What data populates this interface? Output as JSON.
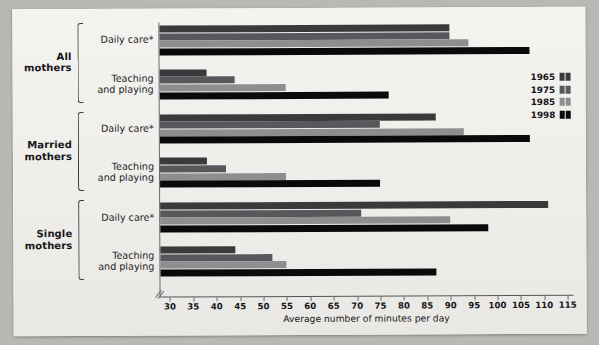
{
  "chart_data": {
    "type": "bar",
    "orientation": "horizontal",
    "title": "",
    "xlabel": "Average number of minutes per day",
    "ylabel": "",
    "xlim": [
      28,
      116
    ],
    "axis_break": true,
    "grid": false,
    "legend_position": "right",
    "xticks": [
      30,
      35,
      40,
      45,
      50,
      55,
      60,
      65,
      70,
      75,
      80,
      85,
      90,
      95,
      100,
      105,
      110,
      115
    ],
    "series": [
      {
        "name": "1965",
        "color": "#3a3a3c"
      },
      {
        "name": "1975",
        "color": "#58585c"
      },
      {
        "name": "1985",
        "color": "#8e8e90"
      },
      {
        "name": "1998",
        "color": "#0a0a0c"
      }
    ],
    "groups": [
      {
        "name": "All mothers",
        "categories": [
          {
            "label_line1": "Daily care*",
            "label_line2": "",
            "values": [
              90,
              90,
              94,
              107
            ]
          },
          {
            "label_line1": "Teaching",
            "label_line2": "and playing",
            "values": [
              38,
              44,
              55,
              77
            ]
          }
        ]
      },
      {
        "name": "Married mothers",
        "categories": [
          {
            "label_line1": "Daily care*",
            "label_line2": "",
            "values": [
              87,
              75,
              93,
              107
            ]
          },
          {
            "label_line1": "Teaching",
            "label_line2": "and playing",
            "values": [
              38,
              42,
              55,
              75
            ]
          }
        ]
      },
      {
        "name": "Single mothers",
        "categories": [
          {
            "label_line1": "Daily care*",
            "label_line2": "",
            "values": [
              111,
              71,
              90,
              98
            ]
          },
          {
            "label_line1": "Teaching",
            "label_line2": "and playing",
            "values": [
              44,
              52,
              55,
              87
            ]
          }
        ]
      }
    ]
  },
  "legend": {
    "items": [
      {
        "label": "1965"
      },
      {
        "label": "1975"
      },
      {
        "label": "1985"
      },
      {
        "label": "1998"
      }
    ]
  },
  "axis": {
    "title": "Average number of minutes per day",
    "break_glyph": "//"
  },
  "groups_display": [
    {
      "title_line1": "All",
      "title_line2": "mothers"
    },
    {
      "title_line1": "Married",
      "title_line2": "mothers"
    },
    {
      "title_line1": "Single",
      "title_line2": "mothers"
    }
  ]
}
